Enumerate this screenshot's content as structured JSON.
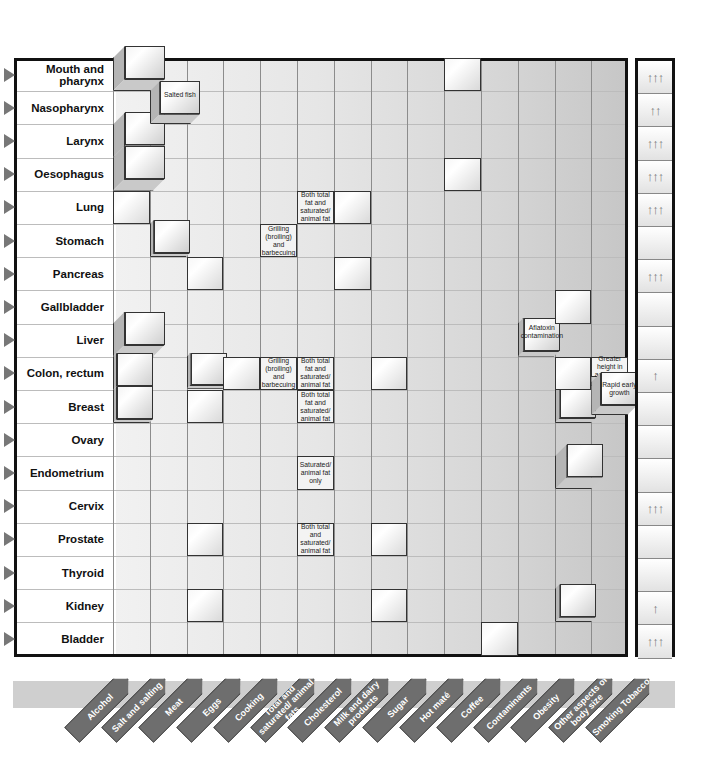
{
  "rows": [
    "Mouth and pharynx",
    "Nasopharynx",
    "Larynx",
    "Oesophagus",
    "Lung",
    "Stomach",
    "Pancreas",
    "Gallbladder",
    "Liver",
    "Colon, rectum",
    "Breast",
    "Ovary",
    "Endometrium",
    "Cervix",
    "Prostate",
    "Thyroid",
    "Kidney",
    "Bladder"
  ],
  "columns": [
    "Alcohol",
    "Salt and salting",
    "Meat",
    "Eggs",
    "Cooking",
    "Total and saturated/ animal fats",
    "Cholesterol",
    "Milk and dairy products",
    "Sugar",
    "Hot maté",
    "Coffee",
    "Contaminants",
    "Obesity",
    "Other aspects of body size",
    "Smoking Tobacco"
  ],
  "notes": {
    "salted_fish": "Salted fish",
    "lung_fat": "Both total fat and saturated/ animal fat",
    "stomach_cooking": "Grilling (broiling) and barbecuing",
    "colon_cooking": "Grilling (broiling) and barbecuing",
    "colon_fat": "Both total fat and saturated/ animal fat",
    "breast_fat": "Both total fat and saturated/ animal fat",
    "endometrium_fat": "Saturated/ animal fat only",
    "prostate_fat": "Both total and saturated/ animal fat",
    "liver_contaminants": "Aflatoxin contamination",
    "colon_height": "Greater height in adulthood",
    "breast_growth": "Rapid early growth"
  },
  "tobacco_arrows": [
    "↑↑↑",
    "↑↑",
    "↑↑↑",
    "↑↑↑",
    "↑↑↑",
    "",
    "↑↑↑",
    "",
    "",
    "↑",
    "",
    "",
    "",
    "↑↑↑",
    "",
    "",
    "↑",
    "↑↑↑"
  ],
  "colors": {
    "grid_border": "#111111",
    "tag_fill": "#6e6e6e",
    "band": "#cfcfcf",
    "arrow": "#7a7a7a"
  }
}
